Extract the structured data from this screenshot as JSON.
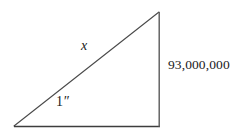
{
  "figure": {
    "type": "right-triangle-diagram",
    "background_color": "#ffffff",
    "stroke_color": "#4a4a4a",
    "text_color": "#1a1a1a",
    "vertices": {
      "bottom_left": [
        14,
        126
      ],
      "bottom_right": [
        159,
        127
      ],
      "top_right": [
        159,
        12
      ]
    },
    "labels": {
      "hypotenuse": "x",
      "base_angle": "1",
      "base_angle_unit": "″",
      "vertical_leg": "93,000,000"
    }
  }
}
